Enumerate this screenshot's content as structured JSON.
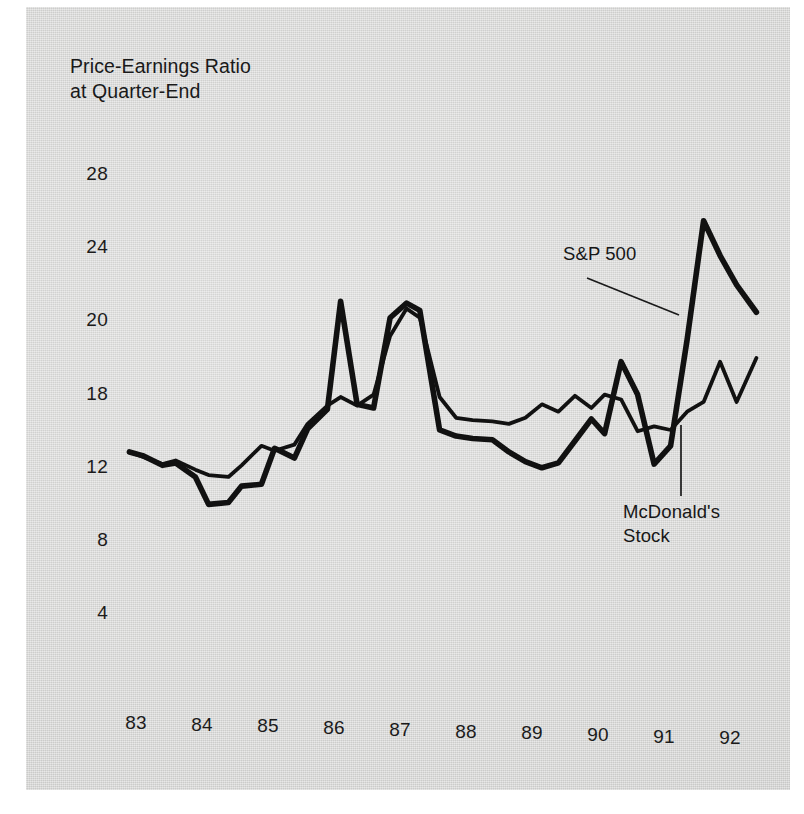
{
  "figure": {
    "background_color": "#ffffff",
    "panel_color": "#d3d3d1",
    "ink_color": "#111111"
  },
  "title": "Price-Earnings Ratio\nat Quarter-End",
  "annotations": [
    {
      "name": "sp500",
      "label": "S&P 500"
    },
    {
      "name": "mcdonalds",
      "label": "McDonald's\nStock"
    }
  ],
  "chart_data": {
    "type": "line",
    "title": "Price-Earnings Ratio at Quarter-End",
    "subtitle": "",
    "xlabel": "",
    "ylabel": "Price-Earnings Ratio at Quarter-End",
    "grid": false,
    "legend_position": "inline-annotation",
    "x_tick_labels": [
      "83",
      "84",
      "85",
      "86",
      "87",
      "88",
      "89",
      "90",
      "91",
      "92"
    ],
    "x_tick_values": [
      83,
      84,
      85,
      86,
      87,
      88,
      89,
      90,
      91,
      92
    ],
    "y_tick_labels": [
      "28",
      "24",
      "20",
      "18",
      "12",
      "8",
      "4"
    ],
    "y_tick_values": [
      28,
      24,
      20,
      18,
      12,
      8,
      4
    ],
    "xlim": [
      82.8,
      92.6
    ],
    "ylim": [
      2,
      30
    ],
    "x_unit": "quarter",
    "series": [
      {
        "name": "S&P 500",
        "line_width_px": 5.6,
        "color": "#111111",
        "x": [
          82.9,
          83.1,
          83.4,
          83.6,
          83.9,
          84.1,
          84.4,
          84.6,
          84.9,
          85.1,
          85.4,
          85.6,
          85.9,
          86.1,
          86.35,
          86.6,
          86.85,
          87.1,
          87.3,
          87.6,
          87.85,
          88.1,
          88.4,
          88.65,
          88.9,
          89.15,
          89.4,
          89.65,
          89.9,
          90.1,
          90.35,
          90.6,
          90.85,
          91.1,
          91.35,
          91.6,
          91.85,
          92.1,
          92.4
        ],
        "y": [
          13.3,
          13.0,
          12.2,
          12.4,
          11.5,
          10.0,
          10.1,
          11.0,
          11.1,
          13.6,
          12.8,
          15.2,
          16.8,
          21.1,
          17.2,
          16.9,
          20.2,
          21.0,
          20.6,
          15.1,
          14.6,
          14.4,
          14.3,
          13.3,
          12.5,
          12.0,
          12.4,
          14.2,
          16.0,
          14.8,
          18.9,
          18.0,
          12.3,
          13.8,
          19.5,
          25.5,
          23.6,
          22.0,
          20.5
        ]
      },
      {
        "name": "McDonald's Stock",
        "line_width_px": 3.8,
        "color": "#111111",
        "x": [
          82.9,
          83.1,
          83.4,
          83.6,
          83.9,
          84.1,
          84.4,
          84.6,
          84.9,
          85.1,
          85.4,
          85.6,
          85.9,
          86.1,
          86.35,
          86.6,
          86.85,
          87.1,
          87.3,
          87.6,
          87.85,
          88.1,
          88.4,
          88.65,
          88.9,
          89.15,
          89.4,
          89.65,
          89.9,
          90.1,
          90.35,
          90.6,
          90.85,
          91.1,
          91.35,
          91.6,
          91.85,
          92.1,
          92.4
        ],
        "y": [
          13.3,
          12.9,
          12.3,
          12.6,
          11.9,
          11.6,
          11.5,
          12.2,
          13.8,
          13.4,
          13.9,
          15.6,
          17.1,
          17.8,
          17.1,
          18.0,
          19.6,
          20.7,
          20.2,
          17.8,
          16.1,
          15.9,
          15.8,
          15.6,
          16.1,
          17.2,
          16.6,
          17.9,
          16.9,
          18.0,
          17.6,
          15.0,
          15.4,
          15.1,
          16.6,
          17.4,
          18.9,
          17.4,
          19.0
        ]
      }
    ]
  }
}
